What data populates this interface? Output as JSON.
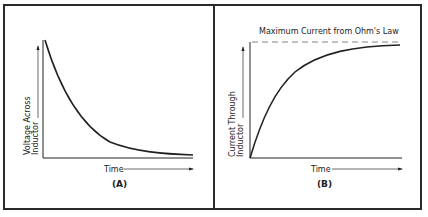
{
  "figure": {
    "panels": [
      {
        "id": "A",
        "panel_label": "(A)",
        "y_axis_label_line1": "Voltage Across",
        "y_axis_label_line2": "Inductor",
        "x_axis_label": "Time",
        "curve": "exponential decay"
      },
      {
        "id": "B",
        "panel_label": "(B)",
        "y_axis_label_line1": "Current Through",
        "y_axis_label_line2": "Inductor",
        "x_axis_label": "Time",
        "asymptote_label": "Maximum Current from Ohm's Law",
        "curve": "exponential rise to asymptote"
      }
    ],
    "colors": {
      "line": "#222222",
      "border": "#2a2a2a",
      "dashed": "#777777",
      "background": "#ffffff"
    }
  }
}
